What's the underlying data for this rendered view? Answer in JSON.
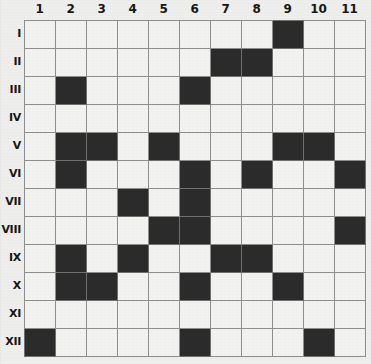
{
  "puzzle": {
    "title": "Grid Puzzle",
    "column_headers": [
      "1",
      "2",
      "3",
      "4",
      "5",
      "6",
      "7",
      "8",
      "9",
      "10",
      "11"
    ],
    "row_headers": [
      "I",
      "II",
      "III",
      "IV",
      "V",
      "VI",
      "VII",
      "VIII",
      "IX",
      "X",
      "XI",
      "XII"
    ],
    "columns": 11,
    "rows": 12,
    "colors": {
      "filled": "#2b2b2b",
      "empty": "#f2f2f0",
      "grid_line": "#8e8e8c",
      "background": "#eeeeec",
      "label_text": "#161616"
    },
    "legend": {
      "filled_label": "filled",
      "empty_label": "empty"
    },
    "cells": [
      [
        0,
        0,
        0,
        0,
        0,
        0,
        0,
        0,
        1,
        0,
        0
      ],
      [
        0,
        0,
        0,
        0,
        0,
        0,
        1,
        1,
        0,
        0,
        0
      ],
      [
        0,
        1,
        0,
        0,
        0,
        1,
        0,
        0,
        0,
        0,
        0
      ],
      [
        0,
        0,
        0,
        0,
        0,
        0,
        0,
        0,
        0,
        0,
        0
      ],
      [
        0,
        1,
        1,
        0,
        1,
        0,
        0,
        0,
        1,
        1,
        0
      ],
      [
        0,
        1,
        0,
        0,
        0,
        1,
        0,
        1,
        0,
        0,
        1
      ],
      [
        0,
        0,
        0,
        1,
        0,
        1,
        0,
        0,
        0,
        0,
        0
      ],
      [
        0,
        0,
        0,
        0,
        1,
        1,
        0,
        0,
        0,
        0,
        1
      ],
      [
        0,
        1,
        0,
        1,
        0,
        0,
        1,
        1,
        0,
        0,
        0
      ],
      [
        0,
        1,
        1,
        0,
        0,
        1,
        0,
        0,
        1,
        0,
        0
      ],
      [
        0,
        0,
        0,
        0,
        0,
        0,
        0,
        0,
        0,
        0,
        0
      ],
      [
        1,
        0,
        0,
        0,
        0,
        1,
        0,
        0,
        0,
        1,
        0
      ]
    ],
    "filled_counts_per_row": [
      1,
      2,
      2,
      0,
      5,
      4,
      2,
      3,
      4,
      4,
      0,
      3
    ],
    "total_filled": 30,
    "total_cells": 132
  }
}
